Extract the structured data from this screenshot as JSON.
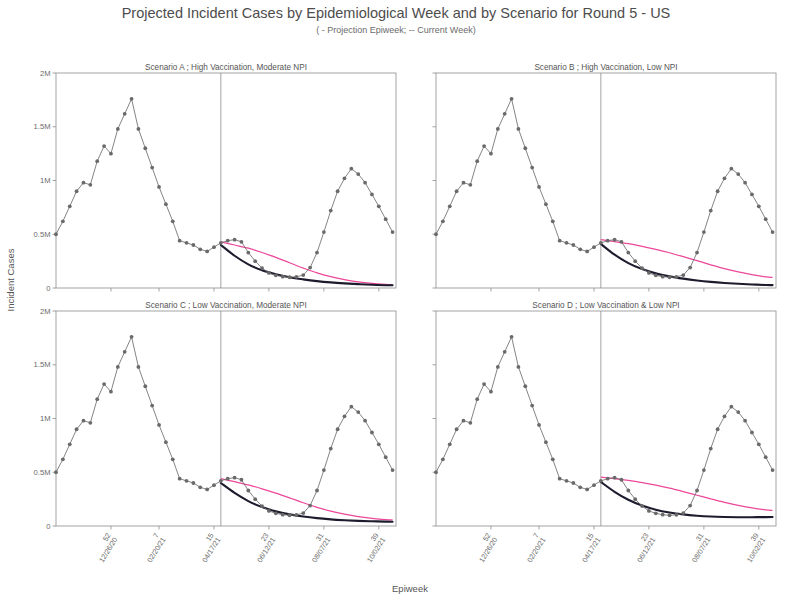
{
  "header": {
    "title": "Projected Incident Cases by Epidemiological Week and by Scenario for Round 5 - US",
    "subtitle": "( - Projection Epiweek; -- Current Week)"
  },
  "axes": {
    "xlabel": "Epiweek",
    "ylabel": "Incident Cases"
  },
  "chart_data": {
    "type": "line",
    "title": "Projected Incident Cases by Epidemiological Week and by Scenario for Round 5 - US",
    "subtitle": "( - Projection Epiweek; -- Current Week)",
    "xlabel": "Epiweek",
    "ylabel": "Incident Cases",
    "grid": false,
    "legend_position": "none",
    "ylim": [
      0,
      2000000
    ],
    "ytick_values": [
      0,
      500000,
      1000000,
      1500000,
      2000000
    ],
    "ytick_labels": [
      "0",
      "0.5M",
      "1M",
      "1.5M",
      "2M"
    ],
    "xlim": [
      40,
      43
    ],
    "xtick_weeks": [
      "52",
      "7",
      "15",
      "23",
      "31",
      "39"
    ],
    "xtick_dates": [
      "12/26/20",
      "02/20/21",
      "04/17/21",
      "06/12/21",
      "08/07/21",
      "10/02/21"
    ],
    "xtick_positions": [
      52,
      59,
      67,
      75,
      83,
      91
    ],
    "projection_start_week": 68,
    "colors": {
      "observed": "#6a6a6a",
      "projection_dark": "#1c1c2e",
      "projection_pink": "#ec4899",
      "frame": "#8d8d8d"
    },
    "series_names": [
      "Observed (reported)",
      "Projection (dark)",
      "Projection (pink)"
    ],
    "panels": [
      {
        "id": "A",
        "title": "Scenario A ; High Vaccination, Moderate NPI",
        "observed": {
          "x": [
            44,
            45,
            46,
            47,
            48,
            49,
            50,
            51,
            52,
            53,
            54,
            55,
            56,
            57,
            58,
            59,
            60,
            61,
            62,
            63,
            64,
            65,
            66,
            67,
            68,
            69,
            70,
            71,
            72,
            73,
            74,
            75,
            76,
            77,
            78,
            79,
            80,
            81,
            82,
            83,
            84,
            85,
            86,
            87,
            88,
            89,
            90,
            91,
            92,
            93
          ],
          "y": [
            500000,
            620000,
            760000,
            900000,
            980000,
            960000,
            1180000,
            1320000,
            1250000,
            1480000,
            1620000,
            1760000,
            1480000,
            1300000,
            1120000,
            940000,
            780000,
            620000,
            440000,
            420000,
            400000,
            360000,
            340000,
            380000,
            420000,
            440000,
            450000,
            430000,
            330000,
            250000,
            185000,
            140000,
            118000,
            105000,
            100000,
            104000,
            120000,
            190000,
            330000,
            520000,
            720000,
            900000,
            1020000,
            1110000,
            1060000,
            980000,
            870000,
            760000,
            640000,
            520000
          ]
        },
        "projection_dark": {
          "x": [
            68,
            70,
            72,
            74,
            76,
            78,
            80,
            82,
            84,
            86,
            88,
            90,
            92,
            93
          ],
          "y": [
            400000,
            300000,
            220000,
            165000,
            128000,
            100000,
            80000,
            64000,
            52000,
            43000,
            36000,
            30000,
            26000,
            25000
          ]
        },
        "projection_pink": {
          "x": [
            68,
            70,
            72,
            74,
            76,
            78,
            80,
            82,
            84,
            86,
            88,
            90,
            92,
            93
          ],
          "y": [
            430000,
            400000,
            370000,
            330000,
            285000,
            235000,
            185000,
            140000,
            105000,
            78000,
            58000,
            44000,
            34000,
            31000
          ]
        }
      },
      {
        "id": "B",
        "title": "Scenario B ; High Vaccination, Low NPI",
        "observed": {
          "x": [
            44,
            45,
            46,
            47,
            48,
            49,
            50,
            51,
            52,
            53,
            54,
            55,
            56,
            57,
            58,
            59,
            60,
            61,
            62,
            63,
            64,
            65,
            66,
            67,
            68,
            69,
            70,
            71,
            72,
            73,
            74,
            75,
            76,
            77,
            78,
            79,
            80,
            81,
            82,
            83,
            84,
            85,
            86,
            87,
            88,
            89,
            90,
            91,
            92,
            93
          ],
          "y": [
            500000,
            620000,
            760000,
            900000,
            980000,
            960000,
            1180000,
            1320000,
            1250000,
            1480000,
            1620000,
            1760000,
            1480000,
            1300000,
            1120000,
            940000,
            780000,
            620000,
            440000,
            420000,
            400000,
            360000,
            340000,
            380000,
            420000,
            440000,
            450000,
            430000,
            330000,
            250000,
            185000,
            140000,
            118000,
            105000,
            100000,
            104000,
            120000,
            190000,
            330000,
            520000,
            720000,
            900000,
            1020000,
            1110000,
            1060000,
            980000,
            870000,
            760000,
            640000,
            520000
          ]
        },
        "projection_dark": {
          "x": [
            68,
            70,
            72,
            74,
            76,
            78,
            80,
            82,
            84,
            86,
            88,
            90,
            92,
            93
          ],
          "y": [
            410000,
            310000,
            232000,
            176000,
            136000,
            108000,
            87000,
            70000,
            57000,
            47000,
            39000,
            33000,
            28000,
            27000
          ]
        },
        "projection_pink": {
          "x": [
            68,
            70,
            72,
            74,
            76,
            78,
            80,
            82,
            84,
            86,
            88,
            90,
            92,
            93
          ],
          "y": [
            450000,
            432000,
            412000,
            388000,
            360000,
            328000,
            292000,
            254000,
            216000,
            180000,
            150000,
            124000,
            104000,
            98000
          ]
        }
      },
      {
        "id": "C",
        "title": "Scenario C ; Low Vaccination, Moderate NPI",
        "observed": {
          "x": [
            44,
            45,
            46,
            47,
            48,
            49,
            50,
            51,
            52,
            53,
            54,
            55,
            56,
            57,
            58,
            59,
            60,
            61,
            62,
            63,
            64,
            65,
            66,
            67,
            68,
            69,
            70,
            71,
            72,
            73,
            74,
            75,
            76,
            77,
            78,
            79,
            80,
            81,
            82,
            83,
            84,
            85,
            86,
            87,
            88,
            89,
            90,
            91,
            92,
            93
          ],
          "y": [
            500000,
            620000,
            760000,
            900000,
            980000,
            960000,
            1180000,
            1320000,
            1250000,
            1480000,
            1620000,
            1760000,
            1480000,
            1300000,
            1120000,
            940000,
            780000,
            620000,
            440000,
            420000,
            400000,
            360000,
            340000,
            380000,
            420000,
            440000,
            450000,
            430000,
            330000,
            250000,
            185000,
            140000,
            118000,
            105000,
            100000,
            104000,
            120000,
            190000,
            330000,
            520000,
            720000,
            900000,
            1020000,
            1110000,
            1060000,
            980000,
            870000,
            760000,
            640000,
            520000
          ]
        },
        "projection_dark": {
          "x": [
            68,
            70,
            72,
            74,
            76,
            78,
            80,
            82,
            84,
            86,
            88,
            90,
            92,
            93
          ],
          "y": [
            400000,
            308000,
            232000,
            176000,
            136000,
            108000,
            88000,
            73000,
            62000,
            54000,
            48000,
            44000,
            41000,
            40000
          ]
        },
        "projection_pink": {
          "x": [
            68,
            70,
            72,
            74,
            76,
            78,
            80,
            82,
            84,
            86,
            88,
            90,
            92,
            93
          ],
          "y": [
            440000,
            412000,
            382000,
            346000,
            306000,
            262000,
            216000,
            174000,
            138000,
            110000,
            88000,
            72000,
            60000,
            57000
          ]
        }
      },
      {
        "id": "D",
        "title": "Scenario D ; Low Vaccination & Low NPI",
        "observed": {
          "x": [
            44,
            45,
            46,
            47,
            48,
            49,
            50,
            51,
            52,
            53,
            54,
            55,
            56,
            57,
            58,
            59,
            60,
            61,
            62,
            63,
            64,
            65,
            66,
            67,
            68,
            69,
            70,
            71,
            72,
            73,
            74,
            75,
            76,
            77,
            78,
            79,
            80,
            81,
            82,
            83,
            84,
            85,
            86,
            87,
            88,
            89,
            90,
            91,
            92,
            93
          ],
          "y": [
            500000,
            620000,
            760000,
            900000,
            980000,
            960000,
            1180000,
            1320000,
            1250000,
            1480000,
            1620000,
            1760000,
            1480000,
            1300000,
            1120000,
            940000,
            780000,
            620000,
            440000,
            420000,
            400000,
            360000,
            340000,
            380000,
            420000,
            440000,
            450000,
            430000,
            330000,
            250000,
            185000,
            140000,
            118000,
            105000,
            100000,
            104000,
            120000,
            190000,
            330000,
            520000,
            720000,
            900000,
            1020000,
            1110000,
            1060000,
            980000,
            870000,
            760000,
            640000,
            520000
          ]
        },
        "projection_dark": {
          "x": [
            68,
            70,
            72,
            74,
            76,
            78,
            80,
            82,
            84,
            86,
            88,
            90,
            92,
            93
          ],
          "y": [
            410000,
            318000,
            244000,
            190000,
            152000,
            126000,
            108000,
            96000,
            88000,
            84000,
            82000,
            82000,
            83000,
            84000
          ]
        },
        "projection_pink": {
          "x": [
            68,
            70,
            72,
            74,
            76,
            78,
            80,
            82,
            84,
            86,
            88,
            90,
            92,
            93
          ],
          "y": [
            455000,
            440000,
            424000,
            404000,
            380000,
            352000,
            320000,
            286000,
            252000,
            220000,
            192000,
            168000,
            150000,
            145000
          ]
        }
      }
    ]
  }
}
